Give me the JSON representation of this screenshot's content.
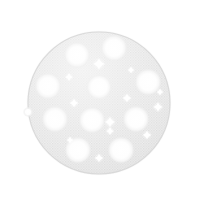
{
  "image": {
    "kind": "product-photo",
    "subject": "mesh sanding disc",
    "width": 197,
    "height": 198,
    "background_color": "#ffffff"
  },
  "disc": {
    "label": "Round mesh abrasive sanding disc",
    "center_x": 99,
    "center_y": 103,
    "radius": 71,
    "body_color": "#e2e2e2",
    "mesh_color": "#cfcfcf",
    "rim_color": "#d6d6d6",
    "shadow_color": "#ededed",
    "mesh_pitch": 2.6
  },
  "holes": {
    "label": "Dust extraction holes",
    "count": 11,
    "fill_color": "#fdfdfd",
    "edge_color": "#f2f2f2",
    "items": [
      {
        "name": "hole-top-left",
        "cx": 77,
        "cy": 55,
        "r": 11.5
      },
      {
        "name": "hole-top-right",
        "cx": 114,
        "cy": 48,
        "r": 11.5
      },
      {
        "name": "hole-upper-left",
        "cx": 48,
        "cy": 86,
        "r": 11.5
      },
      {
        "name": "hole-upper-right",
        "cx": 148,
        "cy": 82,
        "r": 11.5
      },
      {
        "name": "hole-center",
        "cx": 99,
        "cy": 87,
        "r": 11.0
      },
      {
        "name": "hole-mid-left",
        "cx": 55,
        "cy": 119,
        "r": 11.5
      },
      {
        "name": "hole-mid-center",
        "cx": 92,
        "cy": 120,
        "r": 11.5
      },
      {
        "name": "hole-mid-right",
        "cx": 136,
        "cy": 119,
        "r": 11.5
      },
      {
        "name": "hole-bottom-left",
        "cx": 78,
        "cy": 150,
        "r": 11.5
      },
      {
        "name": "hole-bottom-right",
        "cx": 121,
        "cy": 150,
        "r": 11.5
      },
      {
        "name": "hole-lower-edge",
        "cx": 28,
        "cy": 112,
        "r": 3.5
      }
    ]
  },
  "sparkles": {
    "label": "Highlight sparkles",
    "color": "#ffffff",
    "items": [
      {
        "name": "sparkle-top-center",
        "cx": 99,
        "cy": 64,
        "size": 12
      },
      {
        "name": "sparkle-top-left",
        "cx": 69,
        "cy": 77,
        "size": 8
      },
      {
        "name": "sparkle-upper-mid",
        "cx": 127,
        "cy": 98,
        "size": 9
      },
      {
        "name": "sparkle-right-upper",
        "cx": 158,
        "cy": 107,
        "size": 10
      },
      {
        "name": "sparkle-left-mid",
        "cx": 74,
        "cy": 103,
        "size": 9
      },
      {
        "name": "sparkle-center",
        "cx": 110,
        "cy": 122,
        "size": 11
      },
      {
        "name": "sparkle-lower-center",
        "cx": 110,
        "cy": 131,
        "size": 8
      },
      {
        "name": "sparkle-lower-right",
        "cx": 147,
        "cy": 135,
        "size": 9
      },
      {
        "name": "sparkle-bottom-mid",
        "cx": 99,
        "cy": 158,
        "size": 9
      },
      {
        "name": "sparkle-left-lower",
        "cx": 70,
        "cy": 140,
        "size": 7
      },
      {
        "name": "sparkle-right-edge",
        "cx": 160,
        "cy": 92,
        "size": 7
      },
      {
        "name": "sparkle-upper-right",
        "cx": 131,
        "cy": 70,
        "size": 7
      }
    ]
  }
}
